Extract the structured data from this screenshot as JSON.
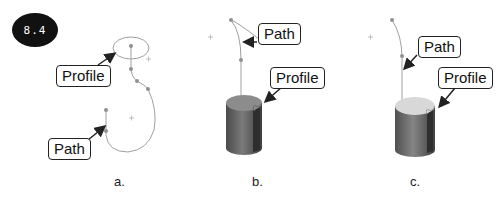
{
  "figure": {
    "badge": "8.4",
    "panels": [
      {
        "id": "a",
        "label": "a.",
        "callouts": {
          "profile": "Profile",
          "path": "Path"
        }
      },
      {
        "id": "b",
        "label": "b.",
        "callouts": {
          "path": "Path",
          "profile": "Profile"
        }
      },
      {
        "id": "c",
        "label": "c.",
        "callouts": {
          "path": "Path",
          "profile": "Profile"
        }
      }
    ]
  },
  "colors": {
    "sketch_line": "#a0a0a0",
    "sketch_point": "#909090",
    "solid_dark": "#5a5a5a",
    "solid_top_b": "#8c8c8c",
    "solid_top_c": "#d8d8d8",
    "badge_bg": "#111111"
  }
}
